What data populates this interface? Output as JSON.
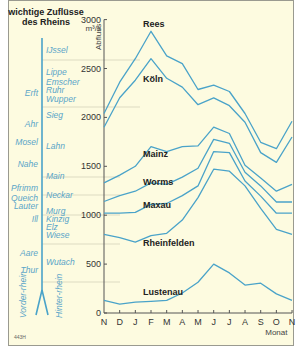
{
  "chart_data": {
    "type": "line",
    "ylabel": "Abfluss",
    "yunit": "m³/s",
    "xlabel": "Monat",
    "ylim": [
      0,
      3000
    ],
    "yticks": [
      0,
      500,
      1000,
      1500,
      2000,
      2500,
      3000
    ],
    "categories": [
      "N",
      "D",
      "J",
      "F",
      "M",
      "A",
      "M",
      "J",
      "J",
      "A",
      "S",
      "O",
      "N"
    ],
    "series": [
      {
        "name": "Rees",
        "values": [
          2040,
          2360,
          2600,
          2880,
          2630,
          2550,
          2285,
          2330,
          2265,
          2040,
          1745,
          1680,
          1960
        ]
      },
      {
        "name": "Köln",
        "values": [
          1900,
          2200,
          2380,
          2600,
          2400,
          2310,
          2130,
          2200,
          2120,
          1950,
          1640,
          1540,
          1800
        ]
      },
      {
        "name": "Mainz",
        "values": [
          1330,
          1410,
          1500,
          1700,
          1650,
          1700,
          1710,
          1900,
          1835,
          1510,
          1380,
          1245,
          1315
        ]
      },
      {
        "name": "Worms",
        "values": [
          1140,
          1200,
          1245,
          1330,
          1315,
          1390,
          1480,
          1775,
          1735,
          1440,
          1300,
          1135,
          1135
        ]
      },
      {
        "name": "Maxau",
        "values": [
          1020,
          1020,
          1030,
          1110,
          1120,
          1200,
          1300,
          1650,
          1640,
          1350,
          1195,
          1020,
          1020
        ]
      },
      {
        "name": "Rheinfelden",
        "values": [
          805,
          770,
          725,
          790,
          815,
          950,
          1180,
          1470,
          1450,
          1300,
          1070,
          855,
          805
        ]
      },
      {
        "name": "Lustenau",
        "values": [
          130,
          90,
          110,
          120,
          130,
          205,
          315,
          500,
          410,
          285,
          305,
          195,
          130
        ]
      }
    ],
    "legend_position": "inline labels",
    "grid": "dotted reference lines at tributary confluences"
  },
  "header": {
    "title_line1": "wichtige Zuflüsse",
    "title_line2": "des Rheins",
    "unit": "m³/s",
    "axis_label": "Abfluss"
  },
  "tributaries_left": [
    {
      "name": "Erft",
      "y": 96
    },
    {
      "name": "Ahr",
      "y": 127
    },
    {
      "name": "Mosel",
      "y": 145
    },
    {
      "name": "Nahe",
      "y": 167
    },
    {
      "name": "Pfrimm",
      "y": 191
    },
    {
      "name": "Queich",
      "y": 201
    },
    {
      "name": "Lauter",
      "y": 209
    },
    {
      "name": "Ill",
      "y": 222
    },
    {
      "name": "Aare",
      "y": 256
    },
    {
      "name": "Thur",
      "y": 273
    }
  ],
  "tributaries_right": [
    {
      "name": "IJssel",
      "y": 53
    },
    {
      "name": "Lippe",
      "y": 75
    },
    {
      "name": "Emscher",
      "y": 85
    },
    {
      "name": "Ruhr",
      "y": 93
    },
    {
      "name": "Wupper",
      "y": 102
    },
    {
      "name": "Sieg",
      "y": 118
    },
    {
      "name": "Lahn",
      "y": 149
    },
    {
      "name": "Main",
      "y": 179
    },
    {
      "name": "Neckar",
      "y": 198
    },
    {
      "name": "Murg",
      "y": 214
    },
    {
      "name": "Kinzig",
      "y": 222
    },
    {
      "name": "Elz",
      "y": 230
    },
    {
      "name": "Wiese",
      "y": 238
    },
    {
      "name": "Wutach",
      "y": 265
    }
  ],
  "source_labels": {
    "vorderrhein": "Vorder-rhein",
    "hinterrhein": "Hinter-rhein"
  },
  "footnote": "443H",
  "colors": {
    "line": "#4aa3c9",
    "background": "#fdfbe0",
    "river": "#4aa3c9"
  }
}
